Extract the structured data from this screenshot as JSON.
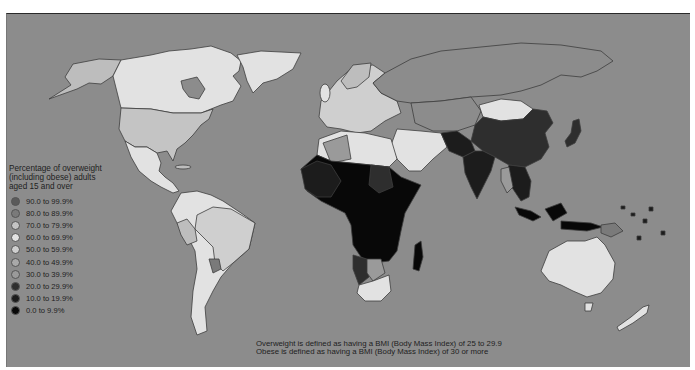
{
  "legend": {
    "title_lines": [
      "Percentage of overweight",
      "(including obese) adults",
      "aged 15 and over"
    ],
    "items": [
      {
        "label": "90.0 to 99.9%",
        "color": "#5a5a5a"
      },
      {
        "label": "80.0 to 89.9%",
        "color": "#7a7a7a"
      },
      {
        "label": "70.0 to 79.9%",
        "color": "#c4c4c4"
      },
      {
        "label": "60.0 to 69.9%",
        "color": "#e2e2e2"
      },
      {
        "label": "50.0 to 59.9%",
        "color": "#cfcfcf"
      },
      {
        "label": "40.0 to 49.9%",
        "color": "#a9a9a9"
      },
      {
        "label": "30.0 to 39.9%",
        "color": "#9a9a9a"
      },
      {
        "label": "20.0 to 29.9%",
        "color": "#2e2e2e"
      },
      {
        "label": "10.0 to 19.9%",
        "color": "#1c1c1c"
      },
      {
        "label": "0.0 to 9.9%",
        "color": "#080808"
      }
    ]
  },
  "notes": [
    "Overweight is defined as having a BMI (Body Mass Index) of 25 to 29.9",
    "Obese is defined as having a BMI (Body Mass Index) of 30 or more"
  ],
  "colors": {
    "ocean": "#8c8c8c",
    "no_data": "#8c8c8c",
    "border": "#3d3d3d"
  },
  "regions": [
    {
      "name": "Canada",
      "class": "60.0 to 69.9%"
    },
    {
      "name": "Greenland",
      "class": "60.0 to 69.9%"
    },
    {
      "name": "Alaska",
      "class": "50.0 to 59.9%"
    },
    {
      "name": "United States",
      "class": "70.0 to 79.9%"
    },
    {
      "name": "Mexico",
      "class": "60.0 to 69.9%"
    },
    {
      "name": "South America",
      "class": "60.0 to 69.9%"
    },
    {
      "name": "Brazil",
      "class": "50.0 to 59.9%"
    },
    {
      "name": "Europe",
      "class": "50.0 to 59.9%"
    },
    {
      "name": "North Africa",
      "class": "60.0 to 69.9%"
    },
    {
      "name": "Sub-Saharan Africa",
      "class": "0.0 to 9.9%"
    },
    {
      "name": "South Africa",
      "class": "60.0 to 69.9%"
    },
    {
      "name": "Middle East",
      "class": "60.0 to 69.9%"
    },
    {
      "name": "Mongolia",
      "class": "60.0 to 69.9%"
    },
    {
      "name": "China",
      "class": "20.0 to 29.9%"
    },
    {
      "name": "India",
      "class": "10.0 to 19.9%"
    },
    {
      "name": "Southeast Asia",
      "class": "10.0 to 19.9%"
    },
    {
      "name": "Japan",
      "class": "20.0 to 29.9%"
    },
    {
      "name": "Indonesia",
      "class": "0.0 to 9.9%"
    },
    {
      "name": "Australia",
      "class": "60.0 to 69.9%"
    },
    {
      "name": "New Zealand",
      "class": "60.0 to 69.9%"
    }
  ]
}
